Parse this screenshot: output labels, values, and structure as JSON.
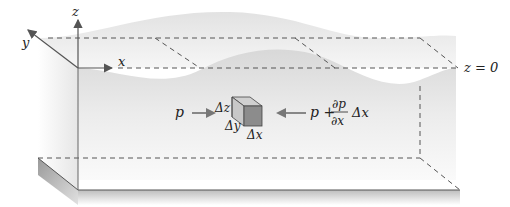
{
  "diagram": {
    "axes": {
      "z_label": "z",
      "y_label": "y",
      "x_label": "x"
    },
    "surface_label": "z = 0",
    "element": {
      "dz_label": "Δz",
      "dy_label": "Δy",
      "dx_label": "Δx"
    },
    "forces": {
      "left_label": "p",
      "right_label_p": "p +",
      "right_frac_num": "∂p",
      "right_frac_den": "∂x",
      "right_label_dx": "Δx"
    },
    "colors": {
      "line": "#555555",
      "dash": "#555555",
      "water_light": "#eeeeee",
      "water_mid": "#d9d9d9",
      "cube_front": "#8a8a8a",
      "cube_side": "#b8b8b8",
      "cube_top": "#cfcfcf",
      "arrow": "#777777"
    }
  }
}
